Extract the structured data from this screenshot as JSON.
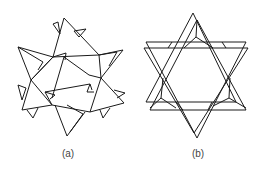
{
  "figure": {
    "panels": [
      {
        "id": "a",
        "caption": "(a)",
        "description": "Tilted polyhedral arrangement of triangles (twisted star configuration)"
      },
      {
        "id": "b",
        "caption": "(b)",
        "description": "Hexagram (six-pointed star) arrangement of triangles viewed along axis"
      }
    ],
    "line_color": "#1a1a1a",
    "background": "#ffffff"
  }
}
